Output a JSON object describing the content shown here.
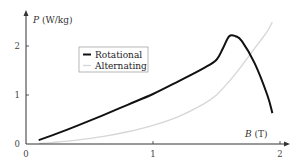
{
  "chart_data": {
    "type": "line",
    "title": "",
    "xlabel": "B (T)",
    "ylabel": "P (W/kg)",
    "xlim": [
      0,
      2.05
    ],
    "ylim": [
      0,
      2.6
    ],
    "xticks": [
      "0",
      "1",
      "2"
    ],
    "yticks": [
      "0",
      "1",
      "2"
    ],
    "grid": false,
    "legend_position": "upper-left-inside",
    "series": [
      {
        "name": "Rotational",
        "color": "#111111",
        "x": [
          0.1,
          0.2,
          0.4,
          0.6,
          0.8,
          1.0,
          1.2,
          1.4,
          1.5,
          1.55,
          1.6,
          1.65,
          1.7,
          1.8,
          1.9,
          1.94
        ],
        "y": [
          0.08,
          0.17,
          0.37,
          0.58,
          0.8,
          1.02,
          1.28,
          1.55,
          1.72,
          1.95,
          2.2,
          2.2,
          2.1,
          1.65,
          1.0,
          0.63
        ]
      },
      {
        "name": "Alternating",
        "color": "#d6d6d6",
        "x": [
          0.1,
          0.2,
          0.4,
          0.6,
          0.8,
          1.0,
          1.2,
          1.4,
          1.5,
          1.6,
          1.7,
          1.8,
          1.9,
          1.94
        ],
        "y": [
          0.01,
          0.03,
          0.08,
          0.15,
          0.25,
          0.38,
          0.56,
          0.82,
          1.0,
          1.28,
          1.6,
          1.95,
          2.3,
          2.49
        ]
      }
    ]
  },
  "axes": {
    "y_label_italic": "P",
    "y_label_unit": "(W/kg)",
    "x_label_italic": "B",
    "x_label_unit": "(T)"
  },
  "legend": {
    "items": [
      {
        "label": "Rotational",
        "color": "#111111"
      },
      {
        "label": "Alternating",
        "color": "#d6d6d6"
      }
    ]
  }
}
